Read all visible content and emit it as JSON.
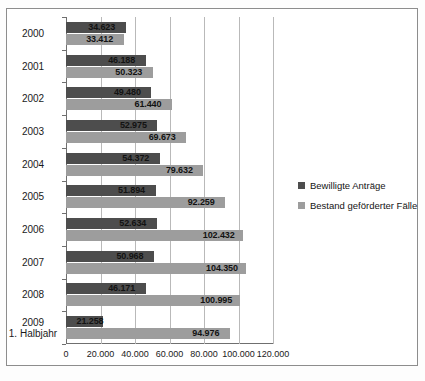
{
  "chart_data": {
    "type": "bar",
    "orientation": "horizontal",
    "title": "",
    "subtitle": "",
    "xlabel": "",
    "ylabel": "",
    "xlim": [
      0,
      120000
    ],
    "xticks": [
      0,
      20000,
      40000,
      60000,
      80000,
      100000,
      120000
    ],
    "xtick_labels": [
      "0",
      "20.000",
      "40.000",
      "60.000",
      "80.000",
      "100.000",
      "120.000"
    ],
    "grid": true,
    "legend_position": "right",
    "categories": [
      "2000",
      "2001",
      "2002",
      "2003",
      "2004",
      "2005",
      "2006",
      "2007",
      "2008",
      "2009\n1. Halbjahr"
    ],
    "series": [
      {
        "name": "Bewilligte Anträge",
        "color": "#4d4d4d",
        "values": [
          34623,
          46188,
          49480,
          52975,
          54372,
          51894,
          52634,
          50968,
          46171,
          21258
        ],
        "labels": [
          "34.623",
          "46.188",
          "49.480",
          "52.975",
          "54.372",
          "51.894",
          "52.634",
          "50.968",
          "46.171",
          "21.258"
        ]
      },
      {
        "name": "Bestand geförderter Fälle",
        "color": "#9d9d9d",
        "values": [
          33412,
          50323,
          61440,
          69673,
          79632,
          92259,
          102432,
          104350,
          100995,
          94976
        ],
        "labels": [
          "33.412",
          "50.323",
          "61.440",
          "69.673",
          "79.632",
          "92.259",
          "102.432",
          "104.350",
          "100.995",
          "94.976"
        ]
      }
    ]
  },
  "legend": {
    "items": [
      {
        "label": "Bewilligte Anträge",
        "color": "#4d4d4d"
      },
      {
        "label": "Bestand geförderter Fälle",
        "color": "#9d9d9d"
      }
    ]
  }
}
